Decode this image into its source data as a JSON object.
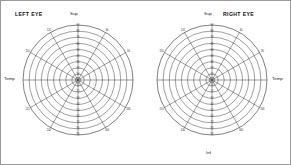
{
  "page": {
    "title_left_eye": "LEFT EYE",
    "title_right_eye": "RIGHT EYE",
    "border_color": "#9a9a9a",
    "line_color": "#2b2b2b"
  },
  "labels": {
    "superior": "Sup",
    "inferior": "Inf",
    "temporal": "Temp",
    "nasal": "Nas"
  },
  "chart_data": {
    "type": "line",
    "subtitle": "Goldmann polar grid — blank recording form",
    "xlabel": "",
    "ylabel": "",
    "grid": true,
    "legend_position": "none",
    "projection": "polar",
    "radial_ticks": [
      10,
      20,
      30,
      40,
      50,
      60,
      70,
      80,
      90
    ],
    "radial_tick_unit": "degrees",
    "rlim": [
      0,
      90
    ],
    "angular_ticks": [
      0,
      30,
      60,
      90,
      120,
      150,
      180,
      210,
      240,
      270,
      300,
      330
    ],
    "angular_tick_unit": "degrees",
    "angular_labels_shown": [
      "30",
      "60",
      "120",
      "150",
      "210",
      "240",
      "300",
      "330"
    ],
    "series": [],
    "charts": [
      {
        "name": "LEFT EYE",
        "center_x": 77,
        "center_y": 79,
        "outer_radius": 55,
        "temporal_side": "left",
        "nasal_side": "right"
      },
      {
        "name": "RIGHT EYE",
        "center_x": 211,
        "center_y": 79,
        "outer_radius": 55,
        "temporal_side": "right",
        "nasal_side": "left"
      }
    ]
  }
}
